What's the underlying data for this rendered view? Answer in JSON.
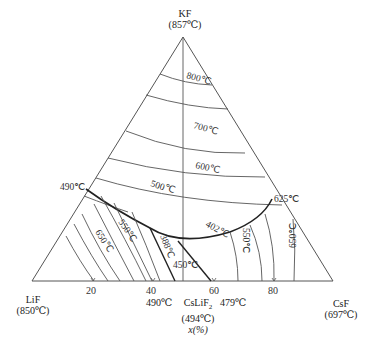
{
  "diagram": {
    "type": "ternary-phase-diagram",
    "vertices": {
      "top": {
        "component": "KF",
        "temp": "(857℃)"
      },
      "left": {
        "component": "LiF",
        "temp": "(850℃)"
      },
      "right": {
        "component": "CsF",
        "temp": "(697℃)"
      }
    },
    "axis_ticks": [
      "20",
      "40",
      "60",
      "80"
    ],
    "axis_label": "x(%)",
    "compound": {
      "name": "CsLiF",
      "subscript": "2",
      "temp": "(494℃)"
    },
    "invariant_points": {
      "left_binary": "490℃",
      "right_binary": "625℃",
      "bottom_left": "490℃",
      "bottom_right": "479℃"
    },
    "isotherms": [
      "800℃",
      "700℃",
      "600℃",
      "500℃",
      "550℃",
      "650℃",
      "388℃",
      "402℃",
      "450℃",
      "550℃",
      "650℃"
    ]
  }
}
